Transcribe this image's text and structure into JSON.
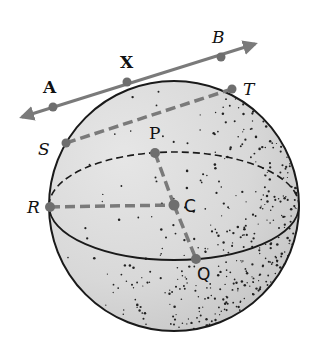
{
  "diagram": {
    "type": "sphere-geometry",
    "colors": {
      "background": "#ffffff",
      "sphere_fill": "#d9d9d9",
      "outline": "#1a1a1a",
      "segment_gray": "#7a7a7a",
      "stipple": "#222222"
    },
    "sphere": {
      "cx": 174,
      "cy": 206,
      "r": 125
    },
    "equator": {
      "cx": 174,
      "cy": 206,
      "rx": 125,
      "ry": 54
    },
    "labels": {
      "A": "A",
      "X": "X",
      "B": "B",
      "T": "T",
      "S": "S",
      "P": "P",
      "R": "R",
      "C": "C",
      "Q": "Q"
    },
    "points": {
      "A": {
        "x": 53,
        "y": 107
      },
      "X": {
        "x": 127,
        "y": 82
      },
      "B": {
        "x": 221,
        "y": 57
      },
      "T": {
        "x": 232,
        "y": 89
      },
      "S": {
        "x": 66,
        "y": 143
      },
      "P": {
        "x": 155,
        "y": 153
      },
      "R": {
        "x": 50,
        "y": 207
      },
      "C": {
        "x": 174,
        "y": 205
      },
      "Q": {
        "x": 196,
        "y": 259
      }
    },
    "tangent_line": {
      "from": "A",
      "through": "X",
      "to": "B",
      "arrows": "both"
    },
    "chords": [
      {
        "from": "S",
        "to": "T",
        "style": "dashed"
      },
      {
        "from": "R",
        "to": "C",
        "style": "dashed"
      },
      {
        "from": "P",
        "to": "C",
        "style": "dashed"
      },
      {
        "from": "C",
        "to": "Q",
        "style": "dashed"
      }
    ]
  }
}
